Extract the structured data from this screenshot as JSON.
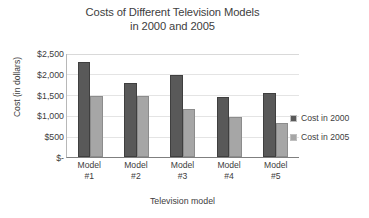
{
  "chart_data": {
    "type": "bar",
    "title": "Costs of Different Television Models in 2000 and 2005",
    "title_lines": [
      "Costs of Different Television Models",
      "in 2000 and 2005"
    ],
    "categories": [
      "Model #1",
      "Model #2",
      "Model #3",
      "Model #4",
      "Model #5"
    ],
    "category_lines": [
      [
        "Model",
        "#1"
      ],
      [
        "Model",
        "#2"
      ],
      [
        "Model",
        "#3"
      ],
      [
        "Model",
        "#4"
      ],
      [
        "Model",
        "#5"
      ]
    ],
    "series": [
      {
        "name": "Cost in 2000",
        "color": "#595959",
        "values": [
          2300,
          1780,
          1970,
          1450,
          1530
        ]
      },
      {
        "name": "Cost in 2005",
        "color": "#a6a6a6",
        "values": [
          1480,
          1470,
          1150,
          950,
          820
        ]
      }
    ],
    "xlabel": "Television model",
    "ylabel": "Cost (in dollars)",
    "ylim": [
      0,
      2500
    ],
    "ytick_values": [
      2500,
      2000,
      1500,
      1000,
      500,
      0
    ],
    "ytick_labels": [
      "$2,500",
      "$2,000",
      "$1,500",
      "$1,000",
      "$500",
      "$-"
    ],
    "grid": true,
    "grid_axis": "y",
    "legend_position": "right",
    "background_color": "#ffffff",
    "text_color": "#404040"
  }
}
